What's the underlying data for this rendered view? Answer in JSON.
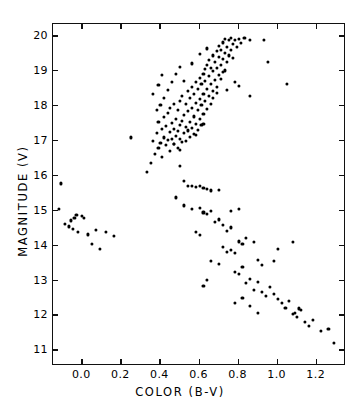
{
  "chart_data": {
    "type": "scatter",
    "title": "",
    "xlabel": "COLOR (B-V)",
    "ylabel": "MAGNITUDE (V)",
    "xlim": [
      -0.15,
      1.35
    ],
    "ylim": [
      20.35,
      10.55
    ],
    "y_inverted": true,
    "grid": false,
    "legend": null,
    "xticks": [
      0.0,
      0.2,
      0.4,
      0.6,
      0.8,
      1.0,
      1.2
    ],
    "xticklabels": [
      "0.0",
      "0.2",
      "0.4",
      "0.6",
      "0.8",
      "1.0",
      "1.2"
    ],
    "yticks": [
      11,
      12,
      13,
      14,
      15,
      16,
      17,
      18,
      19,
      20
    ],
    "yticklabels": [
      "11",
      "12",
      "13",
      "14",
      "15",
      "16",
      "17",
      "18",
      "19",
      "20"
    ],
    "marker": "filled-circle",
    "marker_color": "#000000",
    "frame_color": "#111111",
    "background": "#ffffff",
    "series": [
      {
        "name": "stars",
        "points": [
          [
            -0.12,
            15.05
          ],
          [
            -0.11,
            15.78
          ],
          [
            -0.09,
            14.62
          ],
          [
            -0.07,
            14.55
          ],
          [
            -0.06,
            14.72
          ],
          [
            -0.05,
            14.48
          ],
          [
            -0.04,
            14.8
          ],
          [
            -0.03,
            14.88
          ],
          [
            -0.02,
            14.4
          ],
          [
            0.0,
            14.85
          ],
          [
            0.01,
            14.78
          ],
          [
            0.03,
            14.32
          ],
          [
            0.05,
            14.05
          ],
          [
            0.07,
            14.44
          ],
          [
            0.09,
            13.9
          ],
          [
            0.12,
            14.4
          ],
          [
            0.16,
            14.28
          ],
          [
            0.25,
            17.1
          ],
          [
            0.33,
            16.1
          ],
          [
            0.35,
            16.38
          ],
          [
            0.36,
            17.0
          ],
          [
            0.37,
            16.62
          ],
          [
            0.38,
            17.22
          ],
          [
            0.39,
            16.8
          ],
          [
            0.39,
            17.55
          ],
          [
            0.4,
            16.95
          ],
          [
            0.41,
            17.35
          ],
          [
            0.41,
            16.55
          ],
          [
            0.42,
            17.1
          ],
          [
            0.42,
            17.68
          ],
          [
            0.43,
            16.88
          ],
          [
            0.43,
            17.42
          ],
          [
            0.44,
            17.02
          ],
          [
            0.44,
            17.8
          ],
          [
            0.45,
            16.7
          ],
          [
            0.45,
            17.25
          ],
          [
            0.45,
            17.95
          ],
          [
            0.46,
            17.05
          ],
          [
            0.46,
            17.52
          ],
          [
            0.47,
            16.92
          ],
          [
            0.47,
            17.35
          ],
          [
            0.47,
            18.05
          ],
          [
            0.48,
            17.15
          ],
          [
            0.48,
            17.62
          ],
          [
            0.49,
            16.8
          ],
          [
            0.49,
            17.28
          ],
          [
            0.49,
            17.88
          ],
          [
            0.5,
            17.05
          ],
          [
            0.5,
            17.45
          ],
          [
            0.5,
            18.15
          ],
          [
            0.51,
            16.98
          ],
          [
            0.51,
            17.58
          ],
          [
            0.51,
            18.3
          ],
          [
            0.52,
            17.22
          ],
          [
            0.52,
            17.75
          ],
          [
            0.53,
            17.0
          ],
          [
            0.53,
            17.4
          ],
          [
            0.53,
            18.05
          ],
          [
            0.54,
            17.3
          ],
          [
            0.54,
            17.85
          ],
          [
            0.54,
            18.42
          ],
          [
            0.55,
            17.12
          ],
          [
            0.55,
            17.55
          ],
          [
            0.55,
            18.22
          ],
          [
            0.56,
            17.38
          ],
          [
            0.56,
            17.95
          ],
          [
            0.56,
            18.55
          ],
          [
            0.57,
            17.2
          ],
          [
            0.57,
            17.7
          ],
          [
            0.57,
            18.35
          ],
          [
            0.58,
            17.48
          ],
          [
            0.58,
            18.08
          ],
          [
            0.58,
            18.68
          ],
          [
            0.59,
            17.32
          ],
          [
            0.59,
            17.88
          ],
          [
            0.59,
            18.48
          ],
          [
            0.6,
            17.62
          ],
          [
            0.6,
            18.2
          ],
          [
            0.6,
            18.8
          ],
          [
            0.61,
            17.45
          ],
          [
            0.61,
            18.02
          ],
          [
            0.61,
            18.62
          ],
          [
            0.62,
            17.78
          ],
          [
            0.62,
            18.35
          ],
          [
            0.62,
            18.92
          ],
          [
            0.63,
            18.15
          ],
          [
            0.63,
            18.72
          ],
          [
            0.63,
            19.05
          ],
          [
            0.64,
            17.92
          ],
          [
            0.64,
            18.48
          ],
          [
            0.64,
            19.18
          ],
          [
            0.65,
            18.28
          ],
          [
            0.65,
            18.85
          ],
          [
            0.65,
            19.32
          ],
          [
            0.66,
            18.05
          ],
          [
            0.66,
            18.62
          ],
          [
            0.66,
            19.1
          ],
          [
            0.67,
            18.42
          ],
          [
            0.67,
            19.0
          ],
          [
            0.67,
            19.45
          ],
          [
            0.68,
            18.75
          ],
          [
            0.68,
            19.25
          ],
          [
            0.69,
            18.55
          ],
          [
            0.69,
            19.08
          ],
          [
            0.69,
            19.58
          ],
          [
            0.7,
            18.9
          ],
          [
            0.7,
            19.4
          ],
          [
            0.7,
            19.72
          ],
          [
            0.71,
            19.18
          ],
          [
            0.71,
            19.6
          ],
          [
            0.72,
            18.98
          ],
          [
            0.72,
            19.35
          ],
          [
            0.72,
            19.82
          ],
          [
            0.73,
            19.52
          ],
          [
            0.73,
            19.92
          ],
          [
            0.74,
            19.25
          ],
          [
            0.74,
            19.68
          ],
          [
            0.75,
            19.45
          ],
          [
            0.75,
            19.88
          ],
          [
            0.76,
            19.6
          ],
          [
            0.76,
            19.95
          ],
          [
            0.77,
            19.38
          ],
          [
            0.77,
            19.78
          ],
          [
            0.78,
            19.88
          ],
          [
            0.79,
            19.7
          ],
          [
            0.8,
            19.92
          ],
          [
            0.81,
            19.8
          ],
          [
            0.83,
            19.95
          ],
          [
            0.86,
            19.9
          ],
          [
            0.93,
            19.88
          ],
          [
            0.48,
            18.92
          ],
          [
            0.5,
            19.12
          ],
          [
            0.52,
            18.72
          ],
          [
            0.44,
            18.45
          ],
          [
            0.46,
            18.68
          ],
          [
            0.42,
            18.22
          ],
          [
            0.4,
            18.02
          ],
          [
            0.38,
            17.88
          ],
          [
            0.56,
            19.22
          ],
          [
            0.6,
            19.48
          ],
          [
            0.64,
            19.65
          ],
          [
            0.36,
            18.35
          ],
          [
            0.39,
            18.6
          ],
          [
            0.41,
            18.88
          ],
          [
            0.71,
            18.78
          ],
          [
            0.73,
            19.02
          ],
          [
            0.67,
            18.22
          ],
          [
            0.69,
            18.38
          ],
          [
            0.62,
            17.48
          ],
          [
            0.58,
            17.18
          ],
          [
            0.74,
            18.45
          ],
          [
            0.78,
            18.68
          ],
          [
            0.8,
            18.58
          ],
          [
            0.86,
            18.28
          ],
          [
            0.95,
            19.25
          ],
          [
            1.05,
            18.62
          ],
          [
            0.5,
            16.28
          ],
          [
            0.52,
            15.85
          ],
          [
            0.54,
            15.72
          ],
          [
            0.56,
            15.7
          ],
          [
            0.58,
            15.68
          ],
          [
            0.6,
            15.72
          ],
          [
            0.62,
            15.66
          ],
          [
            0.64,
            15.62
          ],
          [
            0.66,
            15.58
          ],
          [
            0.7,
            15.6
          ],
          [
            0.48,
            15.38
          ],
          [
            0.52,
            15.15
          ],
          [
            0.56,
            15.05
          ],
          [
            0.6,
            15.08
          ],
          [
            0.62,
            14.95
          ],
          [
            0.64,
            14.9
          ],
          [
            0.66,
            15.0
          ],
          [
            0.47,
            16.92
          ],
          [
            0.5,
            16.75
          ],
          [
            0.72,
            14.6
          ],
          [
            0.74,
            14.42
          ],
          [
            0.76,
            14.52
          ],
          [
            0.68,
            14.68
          ],
          [
            0.7,
            14.75
          ],
          [
            0.72,
            13.95
          ],
          [
            0.74,
            13.82
          ],
          [
            0.76,
            13.88
          ],
          [
            0.78,
            13.78
          ],
          [
            0.8,
            14.12
          ],
          [
            0.82,
            14.05
          ],
          [
            0.66,
            13.55
          ],
          [
            0.7,
            13.48
          ],
          [
            0.62,
            12.85
          ],
          [
            0.64,
            13.02
          ],
          [
            0.78,
            13.25
          ],
          [
            0.8,
            13.18
          ],
          [
            0.82,
            13.4
          ],
          [
            0.84,
            12.92
          ],
          [
            0.86,
            13.05
          ],
          [
            0.88,
            12.72
          ],
          [
            0.9,
            12.95
          ],
          [
            0.92,
            12.68
          ],
          [
            0.94,
            12.55
          ],
          [
            0.84,
            14.22
          ],
          [
            0.88,
            14.1
          ],
          [
            0.9,
            13.58
          ],
          [
            0.92,
            13.45
          ],
          [
            0.96,
            12.82
          ],
          [
            0.98,
            12.62
          ],
          [
            1.0,
            12.48
          ],
          [
            1.02,
            12.35
          ],
          [
            1.04,
            12.22
          ],
          [
            1.06,
            12.42
          ],
          [
            1.08,
            12.05
          ],
          [
            1.1,
            11.95
          ],
          [
            1.12,
            12.15
          ],
          [
            1.14,
            11.82
          ],
          [
            1.16,
            11.7
          ],
          [
            1.18,
            11.88
          ],
          [
            1.22,
            11.55
          ],
          [
            1.26,
            11.62
          ],
          [
            1.29,
            11.22
          ],
          [
            1.09,
            12.08
          ],
          [
            1.11,
            12.2
          ],
          [
            0.86,
            12.28
          ],
          [
            0.9,
            12.08
          ],
          [
            0.98,
            13.55
          ],
          [
            1.0,
            13.9
          ],
          [
            1.08,
            14.1
          ],
          [
            0.78,
            12.35
          ],
          [
            0.82,
            12.5
          ],
          [
            0.76,
            14.98
          ],
          [
            0.8,
            15.05
          ],
          [
            0.58,
            14.38
          ],
          [
            0.6,
            14.3
          ]
        ]
      }
    ]
  }
}
